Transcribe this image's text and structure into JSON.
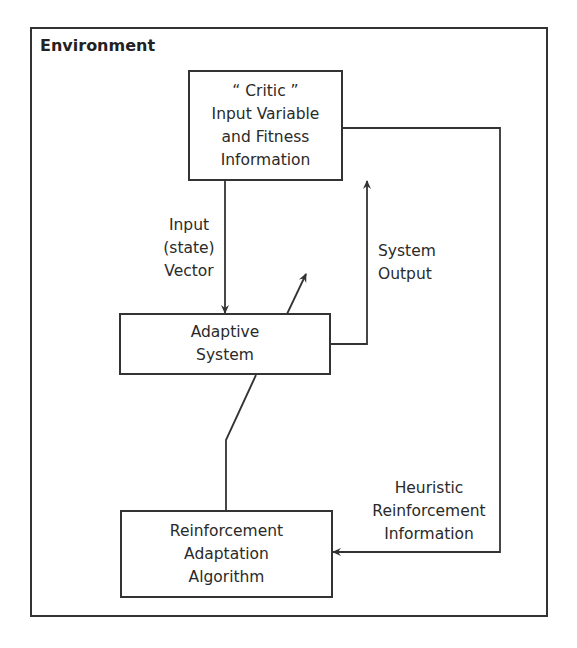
{
  "diagram": {
    "frame_title": "Environment",
    "nodes": {
      "critic": {
        "lines": [
          "“ Critic ”",
          "Input Variable",
          "and Fitness",
          "Information"
        ]
      },
      "adaptive": {
        "lines": [
          "Adaptive",
          "System"
        ]
      },
      "reinforcement": {
        "lines": [
          "Reinforcement",
          "Adaptation",
          "Algorithm"
        ]
      }
    },
    "edges": {
      "input_vector": {
        "lines": [
          "Input",
          "(state)",
          "Vector"
        ]
      },
      "system_output": {
        "lines": [
          "System",
          "Output"
        ]
      },
      "heuristic": {
        "lines": [
          "Heuristic",
          "Reinforcement",
          "Information"
        ]
      }
    },
    "colors": {
      "line": "#333333",
      "text": "#2a2a2a",
      "background": "#ffffff"
    }
  }
}
